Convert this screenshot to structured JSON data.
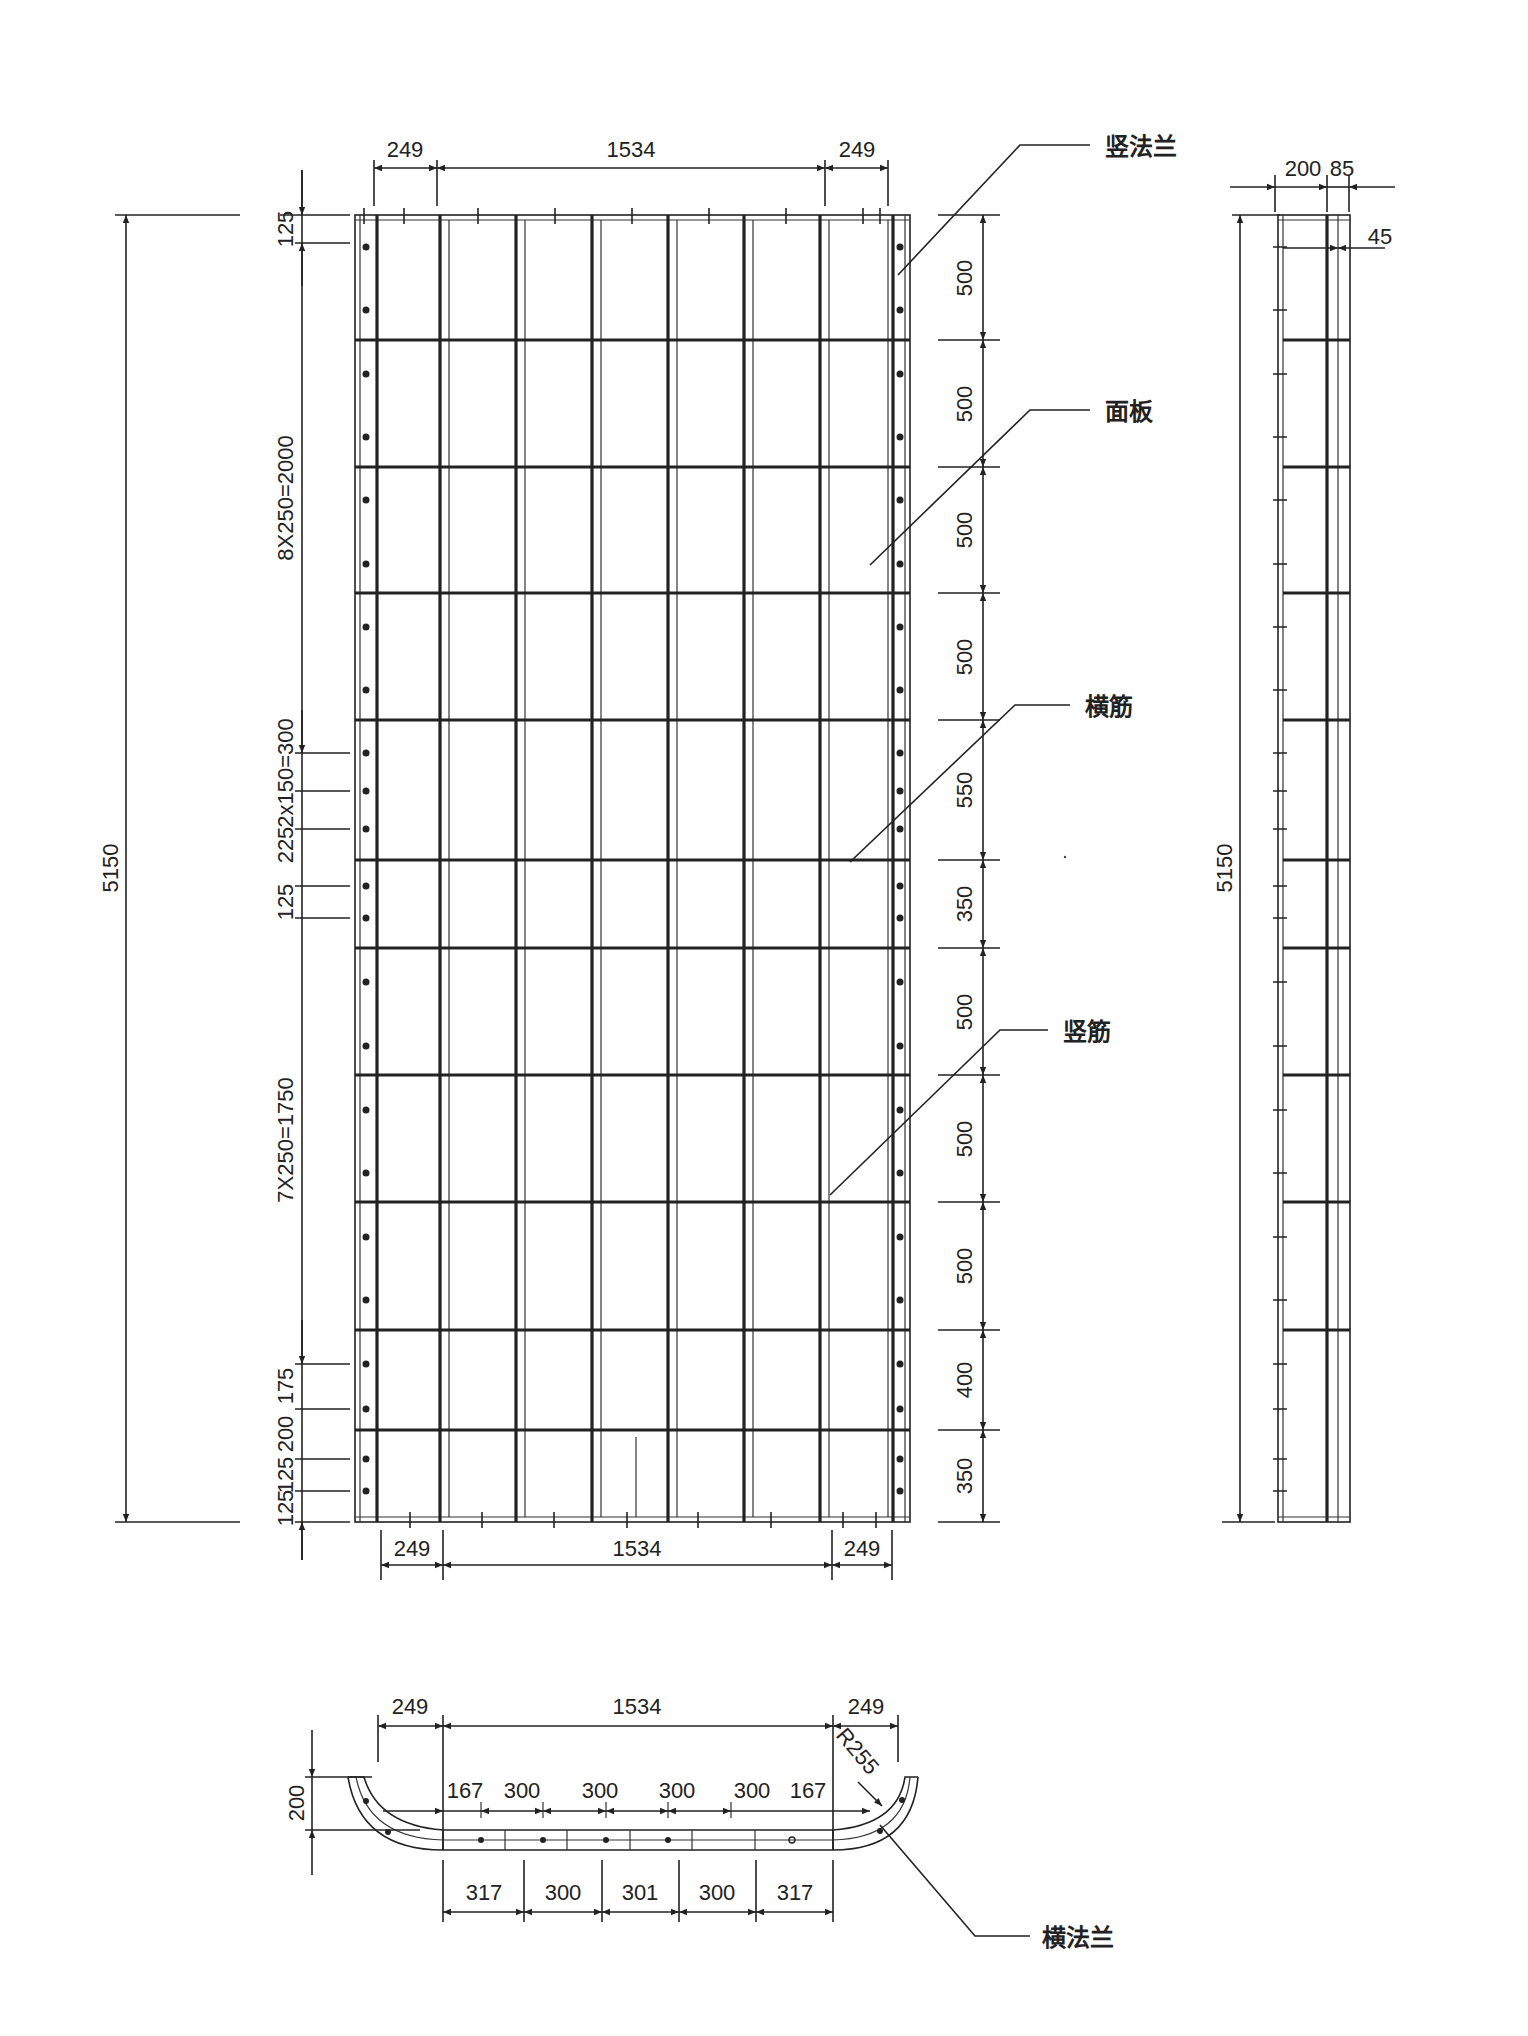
{
  "drawing": {
    "front_view": {
      "top_dims": [
        "249",
        "1534",
        "249"
      ],
      "bottom_dims": [
        "249",
        "1534",
        "249"
      ],
      "overall_height": "5150",
      "left_dims": [
        "125",
        "8X250=2000",
        "2x150=300",
        "225",
        "125",
        "7X250=1750",
        "175",
        "200",
        "125",
        "125",
        "125"
      ],
      "right_dims": [
        "500",
        "500",
        "500",
        "500",
        "550",
        "350",
        "500",
        "500",
        "500",
        "400",
        "350"
      ]
    },
    "side_view": {
      "top_dims": [
        "200",
        "85"
      ],
      "offset_dim": "45",
      "overall_height": "5150"
    },
    "section_view": {
      "top_dims": [
        "249",
        "1534",
        "249"
      ],
      "height_dim": "200",
      "radius": "R255",
      "inner_dims": [
        "167",
        "300",
        "300",
        "300",
        "300",
        "167"
      ],
      "bottom_dims": [
        "317",
        "300",
        "301",
        "300",
        "317"
      ]
    },
    "callouts": {
      "vertical_flange": "竖法兰",
      "face_plate": "面板",
      "horizontal_rib": "横筋",
      "vertical_rib": "竖筋",
      "horizontal_flange": "横法兰"
    }
  }
}
